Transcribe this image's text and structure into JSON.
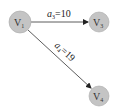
{
  "graph": {
    "nodes": [
      {
        "id": "V1",
        "base": "V",
        "sub": "1",
        "x": 20,
        "y": 22,
        "r": 11
      },
      {
        "id": "V3",
        "base": "V",
        "sub": "3",
        "x": 99,
        "y": 22,
        "r": 10
      },
      {
        "id": "V4",
        "base": "V",
        "sub": "4",
        "x": 99,
        "y": 96,
        "r": 10
      }
    ],
    "edges": [
      {
        "from": "V1",
        "to": "V3",
        "label_base": "a",
        "label_sub": "3",
        "label_value": "=10"
      },
      {
        "from": "V1",
        "to": "V4",
        "label_base": "a",
        "label_sub": "4",
        "label_value": "=19"
      }
    ],
    "colors": {
      "node_fill": "#c4c4c4",
      "node_stroke": "#a8a8a8",
      "edge": "#333333"
    }
  }
}
